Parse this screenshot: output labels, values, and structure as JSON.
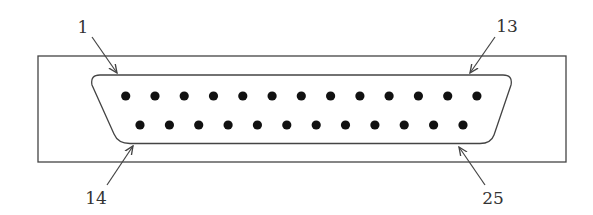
{
  "diagram": {
    "type": "DB-25 connector pinout",
    "colors": {
      "stroke": "#444444",
      "pin": "#111111",
      "background": "#ffffff"
    },
    "outer_frame": {
      "x": 38,
      "y": 56,
      "width": 528,
      "height": 106
    },
    "labels": [
      {
        "id": "pin-1",
        "text": "1",
        "x": 83,
        "y": 33,
        "arrow_from": [
          92,
          37
        ],
        "arrow_to": [
          117,
          73
        ]
      },
      {
        "id": "pin-13",
        "text": "13",
        "x": 507,
        "y": 32,
        "arrow_from": [
          495,
          37
        ],
        "arrow_to": [
          470,
          73
        ]
      },
      {
        "id": "pin-14",
        "text": "14",
        "x": 96,
        "y": 204,
        "arrow_from": [
          107,
          185
        ],
        "arrow_to": [
          133,
          146
        ]
      },
      {
        "id": "pin-25",
        "text": "25",
        "x": 493,
        "y": 204,
        "arrow_from": [
          485,
          185
        ],
        "arrow_to": [
          459,
          147
        ]
      }
    ],
    "top_row": {
      "count": 13,
      "first_pin": 1,
      "last_pin": 13,
      "y": 96,
      "x_start": 125.7,
      "spacing": 29.27
    },
    "bottom_row": {
      "count": 12,
      "first_pin": 14,
      "last_pin": 25,
      "y": 125,
      "x_start": 140,
      "spacing": 29.36
    }
  }
}
